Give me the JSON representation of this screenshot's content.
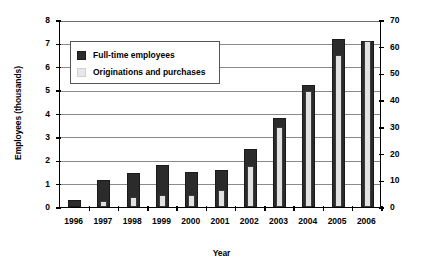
{
  "chart_data": {
    "type": "bar",
    "title": "",
    "xlabel": "Year",
    "ylabel": "Employees (thousands)",
    "ylabel_right": "Originations and purchases ($billions)",
    "categories": [
      "1996",
      "1997",
      "1998",
      "1999",
      "2000",
      "2001",
      "2002",
      "2003",
      "2004",
      "2005",
      "2006"
    ],
    "ylim": [
      0,
      8
    ],
    "yticks": [
      "0",
      "1",
      "2",
      "3",
      "4",
      "5",
      "6",
      "7",
      "8"
    ],
    "ylim_right": [
      0,
      70
    ],
    "yticks_right": [
      "0",
      "10",
      "20",
      "30",
      "40",
      "50",
      "60",
      "70"
    ],
    "grid": true,
    "legend_position": "upper-left-inside",
    "series": [
      {
        "name": "Full-time employees",
        "axis": "left",
        "unit": "thousands",
        "color": "#2b2b2b",
        "values": [
          0.3,
          1.15,
          1.45,
          1.8,
          1.5,
          1.6,
          2.5,
          3.8,
          5.2,
          7.2,
          7.1
        ]
      },
      {
        "name": "Originations and purchases",
        "axis": "right",
        "unit": "$billions",
        "color": "#e2e2e2",
        "values": [
          0,
          2.4,
          3.6,
          4.4,
          4.6,
          6.4,
          15.2,
          29.8,
          43.5,
          57.0,
          62.0
        ]
      }
    ]
  },
  "legend": {
    "items": [
      {
        "label": "Full-time employees",
        "swatch": "dark"
      },
      {
        "label": "Originations and purchases",
        "swatch": "light"
      }
    ]
  }
}
